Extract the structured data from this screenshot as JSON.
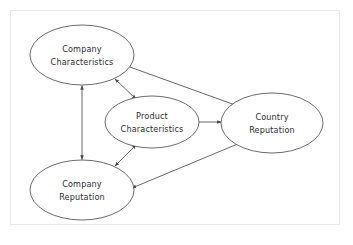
{
  "diagram": {
    "type": "node-link-diagram",
    "background_color": "#ffffff",
    "frame": {
      "visible": true,
      "color": "#e9e9ea",
      "x": 10,
      "y": 10,
      "width": 330,
      "height": 215
    },
    "node_style": {
      "shape": "ellipse",
      "fill": "#ffffff",
      "stroke": "#5b5b5f",
      "text_color": "#2d2d31"
    },
    "edge_style": {
      "stroke": "#55555a",
      "arrowhead": "filled-triangle"
    },
    "nodes": [
      {
        "id": "company-characteristics",
        "label_line1": "Company",
        "label_line2": "Characteristics",
        "cx": 82,
        "cy": 55,
        "rx": 52,
        "ry": 30
      },
      {
        "id": "product-characteristics",
        "label_line1": "Product",
        "label_line2": "Characteristics",
        "cx": 152,
        "cy": 122,
        "rx": 47,
        "ry": 26
      },
      {
        "id": "country-reputation",
        "label_line1": "Country",
        "label_line2": "Reputation",
        "cx": 272,
        "cy": 123,
        "rx": 51,
        "ry": 30
      },
      {
        "id": "company-reputation",
        "label_line1": "Company",
        "label_line2": "Reputation",
        "cx": 82,
        "cy": 190,
        "rx": 52,
        "ry": 30
      }
    ],
    "edges": [
      {
        "id": "edge-compchar-comprep",
        "from": "company-characteristics",
        "to": "company-reputation",
        "direction": "bidirectional",
        "label": ""
      },
      {
        "id": "edge-compchar-prodchar",
        "from": "company-characteristics",
        "to": "product-characteristics",
        "direction": "bidirectional",
        "label": ""
      },
      {
        "id": "edge-comprep-prodchar",
        "from": "company-reputation",
        "to": "product-characteristics",
        "direction": "bidirectional",
        "label": ""
      },
      {
        "id": "edge-compchar-countryrep",
        "from": "company-characteristics",
        "to": "country-reputation",
        "direction": "single",
        "label": ""
      },
      {
        "id": "edge-prodchar-countryrep",
        "from": "product-characteristics",
        "to": "country-reputation",
        "direction": "single",
        "label": ""
      },
      {
        "id": "edge-countryrep-comprep",
        "from": "country-reputation",
        "to": "company-reputation",
        "direction": "single",
        "label": ""
      }
    ]
  }
}
